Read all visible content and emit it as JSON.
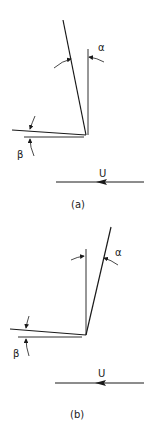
{
  "diagram": {
    "panels": [
      {
        "id": "a",
        "caption": "(a)",
        "angle_top_label": "α",
        "angle_bottom_label": "β",
        "flow_label": "U",
        "flow_direction": "right-to-left"
      },
      {
        "id": "b",
        "caption": "(b)",
        "angle_top_label": "α",
        "angle_bottom_label": "β",
        "flow_label": "U",
        "flow_direction": "right-to-left"
      }
    ],
    "line_color": "#1a1a1a",
    "background": "#ffffff"
  }
}
